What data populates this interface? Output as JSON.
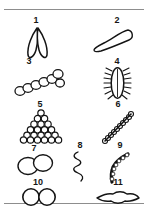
{
  "plate": {
    "title": "",
    "background_color": "#ffffff",
    "ink_color": "#141414",
    "rule_color": "#8d8d8d",
    "columns": 2,
    "figure_count": 11
  },
  "figures": [
    {
      "number": "1",
      "shape": "paired-lanceolate-ovals-v",
      "description": "Two pointed elongated ovals joined at the top forming a V",
      "column": "left",
      "row": 1
    },
    {
      "number": "2",
      "shape": "club-tadpole-outline",
      "description": "Elongated club shape with rounded head at upper right tapering to a point at lower left",
      "column": "right",
      "row": 1
    },
    {
      "number": "3",
      "shape": "circle-chain-curved",
      "description": "Curved chain of eight open circles rising from lower left to upper right",
      "column": "left",
      "row": 2
    },
    {
      "number": "4",
      "shape": "ciliated-oval",
      "description": "Vertical oval body fringed with many short hair-like projections on both sides",
      "column": "right",
      "row": 2
    },
    {
      "number": "5",
      "shape": "triangular-circle-stack",
      "description": "Pyramid-shaped packed stack of small circles, six rows tall",
      "column": "left",
      "row": 3
    },
    {
      "number": "6",
      "shape": "bead-chain-diagonal",
      "description": "Diagonal chain of small dark beads running lower left to upper right",
      "column": "right",
      "row": 3
    },
    {
      "number": "7",
      "shape": "overlapping-circle-pair",
      "description": "Two overlapping open circles, diplococcus form",
      "column": "left",
      "row": 4
    },
    {
      "number": "8",
      "shape": "wavy-filament",
      "description": "Thin vertical wavy squiggle, spirochete-like filament",
      "column": "center",
      "row": 4
    },
    {
      "number": "9",
      "shape": "curved-comma-beads",
      "description": "Hooked comma-shaped curve built of small beads",
      "column": "right",
      "row": 4
    },
    {
      "number": "10",
      "shape": "touching-circle-pair",
      "description": "Two equal circles touching side by side forming a figure eight",
      "column": "left",
      "row": 5
    },
    {
      "number": "11",
      "shape": "lens-blob",
      "description": "Flattened lens or diamond shaped blob with pointed left and right ends",
      "column": "right",
      "row": 5
    }
  ]
}
